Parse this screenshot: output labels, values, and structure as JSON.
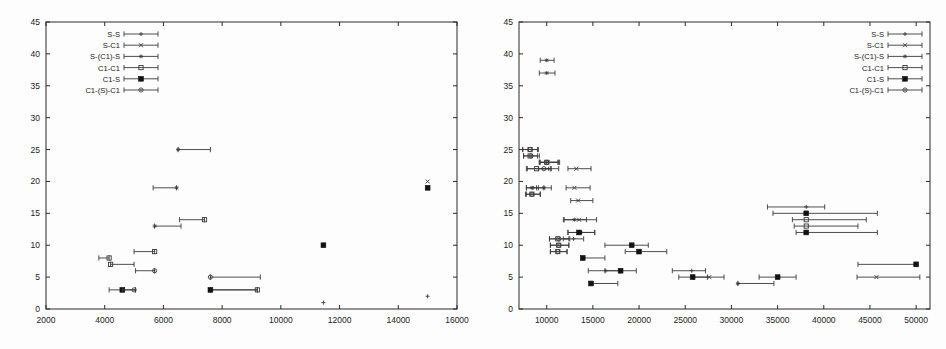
{
  "figure": {
    "background": "#fdfdfd",
    "axis_color": "#2b2b2b",
    "data_color": "#3a3a3a",
    "panel_count": 2
  },
  "chart_data": [
    {
      "type": "scatter",
      "title": "",
      "subtitle": "",
      "xlabel": "",
      "ylabel": "",
      "grid": false,
      "legend_position": "top-left",
      "xlim": [
        2000,
        16000
      ],
      "ylim": [
        0,
        45
      ],
      "xticks": [
        2000,
        4000,
        6000,
        8000,
        10000,
        12000,
        14000,
        16000
      ],
      "yticks": [
        0,
        5,
        10,
        15,
        20,
        25,
        30,
        35,
        40,
        45
      ],
      "xtick_labels": [
        "2000",
        "4000",
        "6000",
        "8000",
        "10000",
        "12000",
        "14000",
        "16000"
      ],
      "ytick_labels": [
        "0",
        "5",
        "10",
        "15",
        "20",
        "25",
        "30",
        "35",
        "40",
        "45"
      ],
      "legend": [
        {
          "label": "S-S",
          "marker": "plus"
        },
        {
          "label": "S-C1",
          "marker": "cross"
        },
        {
          "label": "S-(C1)-S",
          "marker": "star"
        },
        {
          "label": "C1-C1",
          "marker": "open-square"
        },
        {
          "label": "C1-S",
          "marker": "filled-square"
        },
        {
          "label": "C1-(S)-C1",
          "marker": "circle-dot"
        }
      ],
      "series": [
        {
          "name": "S-S",
          "marker": "plus",
          "points": [
            {
              "x": 11450,
              "y": 1,
              "xlo": 11450,
              "xhi": 11450
            },
            {
              "x": 15000,
              "y": 2,
              "xlo": 15000,
              "xhi": 15000
            }
          ]
        },
        {
          "name": "S-C1",
          "marker": "cross",
          "points": [
            {
              "x": 15000,
              "y": 20,
              "xlo": 15000,
              "xhi": 15000
            }
          ]
        },
        {
          "name": "S-(C1)-S",
          "marker": "star",
          "points": [
            {
              "x": 5700,
              "y": 13,
              "xlo": 5700,
              "xhi": 6600
            },
            {
              "x": 6500,
              "y": 25,
              "xlo": 6500,
              "xhi": 7600
            },
            {
              "x": 6450,
              "y": 19,
              "xlo": 5650,
              "xhi": 6450
            }
          ]
        },
        {
          "name": "C1-C1",
          "marker": "open-square",
          "points": [
            {
              "x": 4150,
              "y": 8,
              "xlo": 3800,
              "xhi": 4150
            },
            {
              "x": 4200,
              "y": 7,
              "xlo": 4200,
              "xhi": 5000
            },
            {
              "x": 5700,
              "y": 9,
              "xlo": 5000,
              "xhi": 5700
            },
            {
              "x": 7400,
              "y": 14,
              "xlo": 6550,
              "xhi": 7400
            },
            {
              "x": 9200,
              "y": 3,
              "xlo": 7600,
              "xhi": 9200
            }
          ]
        },
        {
          "name": "C1-S",
          "marker": "filled-square",
          "points": [
            {
              "x": 4600,
              "y": 3,
              "xlo": 4150,
              "xhi": 5050
            },
            {
              "x": 7600,
              "y": 3,
              "xlo": 7600,
              "xhi": 9200
            },
            {
              "x": 11450,
              "y": 10,
              "xlo": 11450,
              "xhi": 11450
            },
            {
              "x": 15000,
              "y": 19,
              "xlo": 15000,
              "xhi": 15000
            }
          ]
        },
        {
          "name": "C1-(S)-C1",
          "marker": "circle-dot",
          "points": [
            {
              "x": 5700,
              "y": 6,
              "xlo": 5050,
              "xhi": 5700
            },
            {
              "x": 5000,
              "y": 3,
              "xlo": 4600,
              "xhi": 5050
            },
            {
              "x": 7600,
              "y": 5,
              "xlo": 7600,
              "xhi": 9300
            }
          ]
        }
      ]
    },
    {
      "type": "scatter",
      "title": "",
      "subtitle": "",
      "xlabel": "",
      "ylabel": "",
      "grid": false,
      "legend_position": "top-right",
      "xlim": [
        7000,
        51500
      ],
      "ylim": [
        0,
        45
      ],
      "xticks": [
        10000,
        15000,
        20000,
        25000,
        30000,
        35000,
        40000,
        45000,
        50000
      ],
      "yticks": [
        0,
        5,
        10,
        15,
        20,
        25,
        30,
        35,
        40,
        45
      ],
      "xtick_labels": [
        "10000",
        "15000",
        "20000",
        "25000",
        "30000",
        "35000",
        "40000",
        "45000",
        "50000"
      ],
      "ytick_labels": [
        "0",
        "5",
        "10",
        "15",
        "20",
        "25",
        "30",
        "35",
        "40",
        "45"
      ],
      "legend": [
        {
          "label": "S-S",
          "marker": "plus"
        },
        {
          "label": "S-C1",
          "marker": "cross"
        },
        {
          "label": "S-(C1)-S",
          "marker": "star"
        },
        {
          "label": "C1-C1",
          "marker": "open-square"
        },
        {
          "label": "C1-S",
          "marker": "filled-square"
        },
        {
          "label": "C1-(S)-C1",
          "marker": "circle-dot"
        }
      ],
      "series": [
        {
          "name": "S-S",
          "marker": "plus",
          "points": [
            {
              "x": 38100,
              "y": 16,
              "xlo": 33900,
              "xhi": 40100
            },
            {
              "x": 25700,
              "y": 6,
              "xlo": 23600,
              "xhi": 27200
            },
            {
              "x": 16400,
              "y": 6,
              "xlo": 14500,
              "xhi": 17900
            },
            {
              "x": 12900,
              "y": 11,
              "xlo": 11800,
              "xhi": 14000
            },
            {
              "x": 10200,
              "y": 22,
              "xlo": 9100,
              "xhi": 11300
            },
            {
              "x": 8500,
              "y": 19,
              "xlo": 7800,
              "xhi": 9700
            }
          ]
        },
        {
          "name": "S-C1",
          "marker": "cross",
          "points": [
            {
              "x": 13500,
              "y": 14,
              "xlo": 11900,
              "xhi": 15400
            },
            {
              "x": 13200,
              "y": 22,
              "xlo": 12300,
              "xhi": 14800
            },
            {
              "x": 13000,
              "y": 19,
              "xlo": 12100,
              "xhi": 14700
            },
            {
              "x": 13400,
              "y": 17,
              "xlo": 12600,
              "xhi": 15000
            },
            {
              "x": 27600,
              "y": 5,
              "xlo": 25900,
              "xhi": 29200
            },
            {
              "x": 45700,
              "y": 5,
              "xlo": 43600,
              "xhi": 50400
            },
            {
              "x": 10100,
              "y": 23,
              "xlo": 9300,
              "xhi": 11400
            }
          ]
        },
        {
          "name": "S-(C1)-S",
          "marker": "star",
          "points": [
            {
              "x": 10000,
              "y": 39,
              "xlo": 9300,
              "xhi": 10800
            },
            {
              "x": 10000,
              "y": 37,
              "xlo": 9200,
              "xhi": 10900
            },
            {
              "x": 9700,
              "y": 19,
              "xlo": 8900,
              "xhi": 10500
            },
            {
              "x": 8400,
              "y": 19,
              "xlo": 7800,
              "xhi": 9100
            },
            {
              "x": 13000,
              "y": 14,
              "xlo": 11800,
              "xhi": 14300
            },
            {
              "x": 13700,
              "y": 12,
              "xlo": 12300,
              "xhi": 15200
            },
            {
              "x": 30700,
              "y": 4,
              "xlo": 30700,
              "xhi": 34600
            }
          ]
        },
        {
          "name": "C1-C1",
          "marker": "open-square",
          "points": [
            {
              "x": 8200,
              "y": 25,
              "xlo": 7400,
              "xhi": 9000
            },
            {
              "x": 8200,
              "y": 24,
              "xlo": 7500,
              "xhi": 9000
            },
            {
              "x": 8900,
              "y": 22,
              "xlo": 7900,
              "xhi": 10400
            },
            {
              "x": 10000,
              "y": 23,
              "xlo": 9200,
              "xhi": 11200
            },
            {
              "x": 8400,
              "y": 18,
              "xlo": 7800,
              "xhi": 9300
            },
            {
              "x": 11200,
              "y": 11,
              "xlo": 10300,
              "xhi": 12500
            },
            {
              "x": 11300,
              "y": 10,
              "xlo": 10400,
              "xhi": 12400
            },
            {
              "x": 11200,
              "y": 9,
              "xlo": 10400,
              "xhi": 12200
            },
            {
              "x": 38100,
              "y": 14,
              "xlo": 36600,
              "xhi": 44600
            },
            {
              "x": 38100,
              "y": 13,
              "xlo": 36800,
              "xhi": 43700
            }
          ]
        },
        {
          "name": "C1-S",
          "marker": "filled-square",
          "points": [
            {
              "x": 38100,
              "y": 15,
              "xlo": 34500,
              "xhi": 45800
            },
            {
              "x": 38100,
              "y": 12,
              "xlo": 37000,
              "xhi": 45800
            },
            {
              "x": 50000,
              "y": 7,
              "xlo": 43700,
              "xhi": 50000
            },
            {
              "x": 35000,
              "y": 5,
              "xlo": 33000,
              "xhi": 37000
            },
            {
              "x": 25800,
              "y": 5,
              "xlo": 24300,
              "xhi": 27400
            },
            {
              "x": 19200,
              "y": 10,
              "xlo": 16300,
              "xhi": 21000
            },
            {
              "x": 20000,
              "y": 9,
              "xlo": 18500,
              "xhi": 23000
            },
            {
              "x": 18000,
              "y": 6,
              "xlo": 16300,
              "xhi": 19700
            },
            {
              "x": 14800,
              "y": 4,
              "xlo": 14800,
              "xhi": 17700
            },
            {
              "x": 13900,
              "y": 8,
              "xlo": 13900,
              "xhi": 16300
            },
            {
              "x": 13500,
              "y": 12,
              "xlo": 12300,
              "xhi": 15200
            }
          ]
        },
        {
          "name": "C1-(S)-C1",
          "marker": "circle-dot",
          "points": [
            {
              "x": 8200,
              "y": 25,
              "xlo": 7400,
              "xhi": 9100
            },
            {
              "x": 8300,
              "y": 24,
              "xlo": 7500,
              "xhi": 9200
            },
            {
              "x": 10000,
              "y": 23,
              "xlo": 9200,
              "xhi": 11300
            },
            {
              "x": 9700,
              "y": 22,
              "xlo": 7800,
              "xhi": 10500
            },
            {
              "x": 8400,
              "y": 18,
              "xlo": 7700,
              "xhi": 9300
            },
            {
              "x": 11300,
              "y": 11,
              "xlo": 10300,
              "xhi": 12400
            },
            {
              "x": 11300,
              "y": 10,
              "xlo": 10400,
              "xhi": 12400
            },
            {
              "x": 11200,
              "y": 9,
              "xlo": 10400,
              "xhi": 12200
            }
          ]
        }
      ]
    }
  ]
}
